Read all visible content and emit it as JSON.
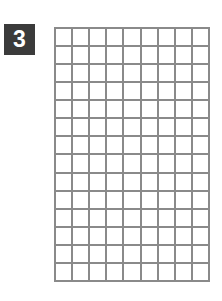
{
  "badge": {
    "label": "3",
    "background": "#3b3b3b",
    "color": "#ffffff"
  },
  "grid": {
    "columns": 9,
    "rows": 14,
    "line_color": "#8a8a8a",
    "cell_fill": "#ffffff"
  }
}
